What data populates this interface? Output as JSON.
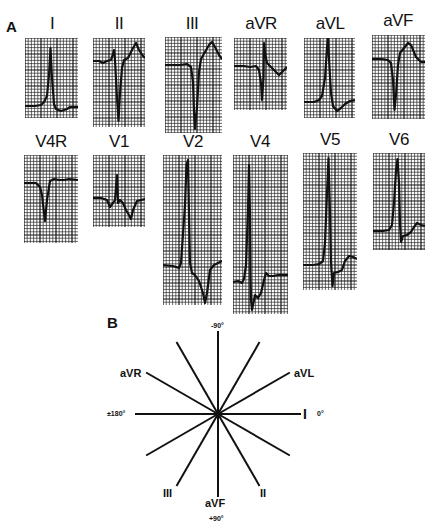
{
  "panels": {
    "a": {
      "letter": "A"
    },
    "b": {
      "letter": "B"
    }
  },
  "colors": {
    "ink": "#111111",
    "grid_minor": "#2a2a2a",
    "background": "#ffffff"
  },
  "ecg": {
    "rows": [
      {
        "leads": [
          {
            "id": "I",
            "label": "I",
            "x": 25,
            "y": 38,
            "w": 53,
            "h": 80,
            "label_x": 22,
            "label_y": 14,
            "trace": [
              [
                0,
                68
              ],
              [
                10,
                68
              ],
              [
                16,
                67
              ],
              [
                19,
                64
              ],
              [
                22,
                58
              ],
              [
                24,
                37
              ],
              [
                25.5,
                10
              ],
              [
                27,
                40
              ],
              [
                29,
                66
              ],
              [
                31,
                71
              ],
              [
                36,
                73
              ],
              [
                42,
                71
              ],
              [
                45,
                69
              ],
              [
                53,
                69
              ]
            ]
          },
          {
            "id": "II",
            "label": "II",
            "x": 93,
            "y": 38,
            "w": 52,
            "h": 89,
            "label_x": 89,
            "label_y": 14,
            "trace": [
              [
                0,
                23
              ],
              [
                6,
                23
              ],
              [
                10,
                25
              ],
              [
                14,
                23
              ],
              [
                18,
                22
              ],
              [
                20,
                16
              ],
              [
                21,
                12
              ],
              [
                22,
                22
              ],
              [
                24,
                60
              ],
              [
                25.5,
                83
              ],
              [
                27,
                55
              ],
              [
                29,
                30
              ],
              [
                31,
                22
              ],
              [
                35,
                20
              ],
              [
                40,
                10
              ],
              [
                43,
                5
              ],
              [
                46,
                12
              ],
              [
                50,
                18
              ],
              [
                52,
                20
              ]
            ]
          },
          {
            "id": "III",
            "label": "III",
            "x": 165,
            "y": 37,
            "w": 57,
            "h": 96,
            "label_x": 162,
            "label_y": 14,
            "trace": [
              [
                0,
                28
              ],
              [
                15,
                28
              ],
              [
                22,
                27
              ],
              [
                26,
                30
              ],
              [
                28,
                45
              ],
              [
                29,
                75
              ],
              [
                30,
                92
              ],
              [
                32,
                70
              ],
              [
                34,
                35
              ],
              [
                36,
                22
              ],
              [
                40,
                15
              ],
              [
                44,
                8
              ],
              [
                47,
                5
              ],
              [
                50,
                10
              ],
              [
                54,
                18
              ],
              [
                57,
                22
              ]
            ]
          },
          {
            "id": "aVR",
            "label": "aVR",
            "x": 234,
            "y": 38,
            "w": 53,
            "h": 72,
            "label_x": 231,
            "label_y": 14,
            "trace": [
              [
                0,
                28
              ],
              [
                10,
                28
              ],
              [
                16,
                29
              ],
              [
                22,
                28
              ],
              [
                25,
                32
              ],
              [
                27,
                45
              ],
              [
                28,
                62
              ],
              [
                29.5,
                40
              ],
              [
                30,
                5
              ],
              [
                31,
                15
              ],
              [
                33,
                25
              ],
              [
                36,
                28
              ],
              [
                40,
                32
              ],
              [
                45,
                37
              ],
              [
                49,
                33
              ],
              [
                53,
                29
              ]
            ]
          },
          {
            "id": "aVL",
            "label": "aVL",
            "x": 304,
            "y": 38,
            "w": 51,
            "h": 80,
            "label_x": 300,
            "label_y": 14,
            "trace": [
              [
                0,
                64
              ],
              [
                10,
                64
              ],
              [
                15,
                62
              ],
              [
                18,
                58
              ],
              [
                21,
                40
              ],
              [
                23,
                10
              ],
              [
                24,
                1
              ],
              [
                25.5,
                30
              ],
              [
                27,
                55
              ],
              [
                29,
                68
              ],
              [
                33,
                73
              ],
              [
                37,
                70
              ],
              [
                41,
                66
              ],
              [
                46,
                63
              ],
              [
                51,
                62
              ]
            ]
          },
          {
            "id": "aVF",
            "label": "aVF",
            "x": 372,
            "y": 35,
            "w": 53,
            "h": 84,
            "label_x": 368,
            "label_y": 11,
            "trace": [
              [
                0,
                24
              ],
              [
                10,
                24
              ],
              [
                16,
                25
              ],
              [
                19,
                28
              ],
              [
                21,
                45
              ],
              [
                22.5,
                75
              ],
              [
                24,
                60
              ],
              [
                26,
                30
              ],
              [
                28,
                18
              ],
              [
                32,
                13
              ],
              [
                36,
                8
              ],
              [
                39,
                10
              ],
              [
                44,
                22
              ],
              [
                49,
                27
              ],
              [
                53,
                27
              ]
            ]
          }
        ]
      },
      {
        "leads": [
          {
            "id": "V4R",
            "label": "V4R",
            "x": 24,
            "y": 155,
            "w": 54,
            "h": 88,
            "label_x": 21,
            "label_y": 132,
            "trace": [
              [
                0,
                28
              ],
              [
                6,
                28
              ],
              [
                12,
                28
              ],
              [
                16,
                32
              ],
              [
                18,
                40
              ],
              [
                20,
                58
              ],
              [
                21,
                66
              ],
              [
                23,
                45
              ],
              [
                26,
                26
              ],
              [
                30,
                24
              ],
              [
                35,
                25
              ],
              [
                40,
                25
              ],
              [
                45,
                24
              ],
              [
                54,
                25
              ]
            ]
          },
          {
            "id": "V1",
            "label": "V1",
            "x": 93,
            "y": 155,
            "w": 52,
            "h": 72,
            "label_x": 89,
            "label_y": 132,
            "trace": [
              [
                0,
                43
              ],
              [
                8,
                43
              ],
              [
                14,
                45
              ],
              [
                17,
                52
              ],
              [
                20,
                48
              ],
              [
                22,
                45
              ],
              [
                24,
                20
              ],
              [
                25,
                48
              ],
              [
                27,
                45
              ],
              [
                30,
                48
              ],
              [
                33,
                55
              ],
              [
                36,
                60
              ],
              [
                38,
                64
              ],
              [
                40,
                55
              ],
              [
                44,
                46
              ],
              [
                52,
                44
              ]
            ]
          },
          {
            "id": "V2",
            "label": "V2",
            "x": 163,
            "y": 155,
            "w": 59,
            "h": 150,
            "label_x": 163,
            "label_y": 132,
            "trace": [
              [
                0,
                110
              ],
              [
                10,
                111
              ],
              [
                16,
                113
              ],
              [
                18,
                108
              ],
              [
                22,
                50
              ],
              [
                23.5,
                10
              ],
              [
                25,
                5
              ],
              [
                26,
                60
              ],
              [
                27,
                108
              ],
              [
                29,
                118
              ],
              [
                32,
                120
              ],
              [
                36,
                126
              ],
              [
                40,
                138
              ],
              [
                42,
                148
              ],
              [
                44,
                138
              ],
              [
                47,
                115
              ],
              [
                51,
                110
              ],
              [
                55,
                108
              ],
              [
                59,
                106
              ]
            ]
          },
          {
            "id": "V4",
            "label": "V4",
            "x": 233,
            "y": 155,
            "w": 55,
            "h": 159,
            "label_x": 230,
            "label_y": 132,
            "trace": [
              [
                0,
                127
              ],
              [
                5,
                126
              ],
              [
                9,
                128
              ],
              [
                11,
                124
              ],
              [
                13,
                110
              ],
              [
                15,
                55
              ],
              [
                16,
                10
              ],
              [
                17,
                60
              ],
              [
                17.5,
                120
              ],
              [
                18,
                145
              ],
              [
                19,
                155
              ],
              [
                22,
                140
              ],
              [
                25,
                143
              ],
              [
                28,
                138
              ],
              [
                31,
                125
              ],
              [
                33,
                118
              ],
              [
                36,
                121
              ],
              [
                40,
                121
              ],
              [
                45,
                120
              ],
              [
                55,
                120
              ]
            ]
          },
          {
            "id": "V5",
            "label": "V5",
            "x": 303,
            "y": 153,
            "w": 54,
            "h": 137,
            "label_x": 300,
            "label_y": 130,
            "trace": [
              [
                0,
                112
              ],
              [
                10,
                112
              ],
              [
                16,
                111
              ],
              [
                20,
                108
              ],
              [
                22,
                90
              ],
              [
                24,
                40
              ],
              [
                25.5,
                5
              ],
              [
                27,
                60
              ],
              [
                28,
                110
              ],
              [
                29.5,
                133
              ],
              [
                31,
                120
              ],
              [
                35,
                119
              ],
              [
                39,
                117
              ],
              [
                42,
                108
              ],
              [
                46,
                103
              ],
              [
                50,
                104
              ],
              [
                54,
                106
              ]
            ]
          },
          {
            "id": "V6",
            "label": "V6",
            "x": 373,
            "y": 153,
            "w": 52,
            "h": 97,
            "label_x": 369,
            "label_y": 130,
            "trace": [
              [
                0,
                78
              ],
              [
                10,
                78
              ],
              [
                16,
                77
              ],
              [
                19,
                72
              ],
              [
                21,
                50
              ],
              [
                23,
                18
              ],
              [
                24.5,
                6
              ],
              [
                26,
                30
              ],
              [
                27,
                70
              ],
              [
                28,
                89
              ],
              [
                30,
                83
              ],
              [
                34,
                82
              ],
              [
                38,
                79
              ],
              [
                41,
                74
              ],
              [
                44,
                70
              ],
              [
                48,
                72
              ],
              [
                52,
                73
              ]
            ]
          }
        ]
      }
    ]
  },
  "axis_diagram": {
    "center": {
      "x": 218,
      "y": 414
    },
    "ray_length": 83,
    "lead_labels": [
      {
        "name": "aVR",
        "text": "aVR",
        "x": 120,
        "y": 367
      },
      {
        "name": "aVL",
        "text": "aVL",
        "x": 294,
        "y": 367
      },
      {
        "name": "I",
        "text": "I",
        "x": 303,
        "y": 406
      },
      {
        "name": "III",
        "text": "III",
        "x": 163,
        "y": 487
      },
      {
        "name": "II",
        "text": "II",
        "x": 260,
        "y": 487
      },
      {
        "name": "aVF",
        "text": "aVF",
        "x": 205,
        "y": 497
      }
    ],
    "degree_labels": [
      {
        "name": "minus-90",
        "text": "-90°",
        "x": 211,
        "y": 322
      },
      {
        "name": "zero",
        "text": "0°",
        "x": 317,
        "y": 410
      },
      {
        "name": "pm-180",
        "text": "±180°",
        "x": 107,
        "y": 410
      },
      {
        "name": "plus-90",
        "text": "+90°",
        "x": 209,
        "y": 515
      }
    ],
    "rays_deg": [
      0,
      30,
      60,
      90,
      120,
      150,
      180,
      210,
      240,
      270,
      300,
      330
    ]
  }
}
